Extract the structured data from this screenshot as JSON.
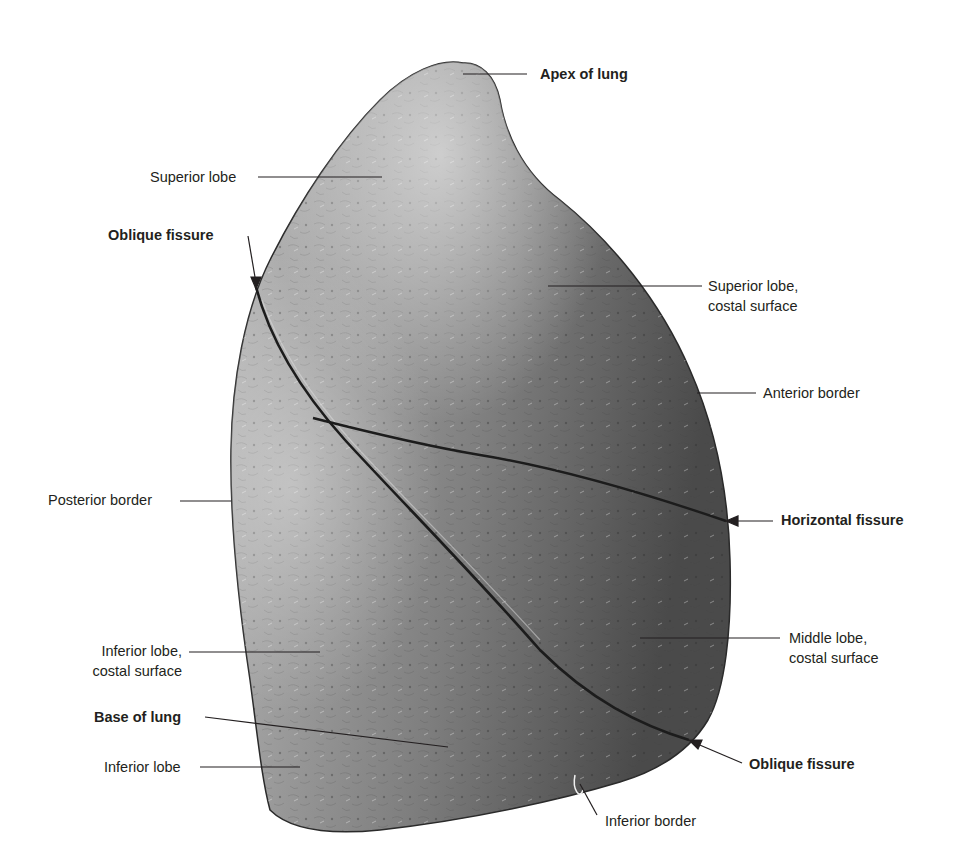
{
  "figure": {
    "colors": {
      "background": "#ffffff",
      "lung_light": "#b9b9b9",
      "lung_mid": "#8a8a8a",
      "lung_dark": "#4e4e4e",
      "fissure": "#1c1c1c",
      "leader_line": "#231f20",
      "label_text": "#231f20"
    },
    "labels": [
      {
        "id": "apex",
        "text": "Apex of lung",
        "bold": true,
        "x": 540,
        "y": 66,
        "anchor": [
          463,
          74
        ],
        "line_from": [
          527,
          74
        ],
        "arrow": false
      },
      {
        "id": "superior-lobe",
        "text": "Superior lobe",
        "bold": false,
        "x": 150,
        "y": 168,
        "anchor": [
          382,
          177
        ],
        "line_from": [
          258,
          177
        ],
        "arrow": false
      },
      {
        "id": "oblique-fissure-top",
        "text": "Oblique fissure",
        "bold": true,
        "x": 108,
        "y": 226,
        "anchor": [
          256,
          287
        ],
        "line_from": [
          248,
          236
        ],
        "arrow": true
      },
      {
        "id": "superior-lobe-costal",
        "lines": [
          "Superior lobe,",
          "costal surface"
        ],
        "bold": false,
        "x": 708,
        "y": 276,
        "anchor": [
          548,
          286
        ],
        "line_from": [
          702,
          286
        ],
        "arrow": false
      },
      {
        "id": "anterior-border",
        "text": "Anterior border",
        "bold": false,
        "x": 763,
        "y": 383,
        "anchor": [
          697,
          393
        ],
        "line_from": [
          756,
          393
        ],
        "arrow": false
      },
      {
        "id": "posterior-border",
        "text": "Posterior border",
        "bold": false,
        "x": 48,
        "y": 490,
        "anchor": [
          231,
          501
        ],
        "line_from": [
          180,
          501
        ],
        "arrow": false
      },
      {
        "id": "horizontal-fissure",
        "text": "Horizontal fissure",
        "bold": true,
        "x": 781,
        "y": 510,
        "anchor": [
          726,
          521
        ],
        "line_from": [
          773,
          521
        ],
        "arrow": true
      },
      {
        "id": "middle-lobe-costal",
        "lines": [
          "Middle lobe,",
          "costal surface"
        ],
        "bold": false,
        "x": 789,
        "y": 628,
        "anchor": [
          640,
          638
        ],
        "line_from": [
          780,
          638
        ],
        "arrow": false
      },
      {
        "id": "inferior-lobe-costal",
        "lines": [
          "Inferior lobe,",
          "costal surface"
        ],
        "bold": false,
        "x": 87,
        "y": 641,
        "anchor": [
          320,
          652
        ],
        "line_from": [
          189,
          652
        ],
        "arrow": false
      },
      {
        "id": "base-of-lung",
        "text": "Base of lung",
        "bold": true,
        "x": 94,
        "y": 708,
        "anchor": [
          448,
          747
        ],
        "line_from": [
          205,
          717
        ],
        "arrow": false
      },
      {
        "id": "oblique-fissure-bottom",
        "text": "Oblique fissure",
        "bold": true,
        "x": 749,
        "y": 754,
        "anchor": [
          689,
          740
        ],
        "line_from": [
          742,
          763
        ],
        "arrow": true
      },
      {
        "id": "inferior-lobe",
        "text": "Inferior lobe",
        "bold": false,
        "x": 104,
        "y": 758,
        "anchor": [
          300,
          767
        ],
        "line_from": [
          200,
          767
        ],
        "arrow": false
      },
      {
        "id": "inferior-border",
        "text": "Inferior border",
        "bold": false,
        "x": 605,
        "y": 811,
        "anchor": [
          580,
          784
        ],
        "line_from": [
          597,
          815
        ],
        "arrow": false
      }
    ]
  }
}
